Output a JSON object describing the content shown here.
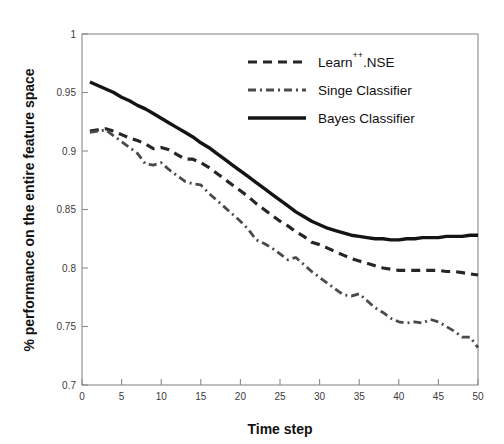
{
  "chart_data": {
    "type": "line",
    "title": "",
    "xlabel": "Time step",
    "ylabel": "% performance on the entire feature space",
    "xlim": [
      0,
      50
    ],
    "ylim": [
      0.7,
      1
    ],
    "grid": false,
    "legend_position": "top-right",
    "xticks": [
      0,
      5,
      10,
      15,
      20,
      25,
      30,
      35,
      40,
      45,
      50
    ],
    "xtick_labels": [
      "0",
      "5",
      "10",
      "15",
      "20",
      "25",
      "30",
      "35",
      "40",
      "45",
      "50"
    ],
    "yticks": [
      0.7,
      0.75,
      0.8,
      0.85,
      0.9,
      0.95,
      1
    ],
    "ytick_labels": [
      "0.7",
      "0.75",
      "0.8",
      "0.85",
      "0.9",
      "0.95",
      "1"
    ],
    "x": [
      1,
      2,
      3,
      4,
      5,
      6,
      7,
      8,
      9,
      10,
      11,
      12,
      13,
      14,
      15,
      16,
      17,
      18,
      19,
      20,
      21,
      22,
      23,
      24,
      25,
      26,
      27,
      28,
      29,
      30,
      31,
      32,
      33,
      34,
      35,
      36,
      37,
      38,
      39,
      40,
      41,
      42,
      43,
      44,
      45,
      46,
      47,
      48,
      49,
      50
    ],
    "series": [
      {
        "name": "Learn++.NSE",
        "style": "dashed",
        "color": "#262626",
        "values": [
          0.917,
          0.918,
          0.919,
          0.917,
          0.914,
          0.911,
          0.909,
          0.906,
          0.902,
          0.903,
          0.901,
          0.897,
          0.893,
          0.893,
          0.89,
          0.886,
          0.881,
          0.876,
          0.871,
          0.866,
          0.861,
          0.855,
          0.85,
          0.845,
          0.84,
          0.836,
          0.831,
          0.827,
          0.822,
          0.82,
          0.817,
          0.814,
          0.811,
          0.808,
          0.806,
          0.804,
          0.802,
          0.8,
          0.799,
          0.798,
          0.798,
          0.798,
          0.798,
          0.798,
          0.798,
          0.797,
          0.797,
          0.796,
          0.795,
          0.794
        ]
      },
      {
        "name": "Singe Classifier",
        "style": "dash-dot",
        "color": "#4a4a4a",
        "values": [
          0.916,
          0.917,
          0.918,
          0.913,
          0.908,
          0.903,
          0.898,
          0.889,
          0.888,
          0.89,
          0.884,
          0.879,
          0.874,
          0.872,
          0.871,
          0.864,
          0.858,
          0.852,
          0.846,
          0.84,
          0.833,
          0.824,
          0.821,
          0.817,
          0.812,
          0.807,
          0.809,
          0.803,
          0.797,
          0.792,
          0.787,
          0.782,
          0.777,
          0.776,
          0.778,
          0.772,
          0.766,
          0.762,
          0.757,
          0.754,
          0.753,
          0.754,
          0.753,
          0.756,
          0.754,
          0.75,
          0.746,
          0.741,
          0.741,
          0.732
        ]
      },
      {
        "name": "Bayes Classifier",
        "style": "solid",
        "color": "#141414",
        "values": [
          0.959,
          0.956,
          0.953,
          0.95,
          0.946,
          0.943,
          0.939,
          0.936,
          0.932,
          0.928,
          0.924,
          0.92,
          0.916,
          0.912,
          0.907,
          0.903,
          0.898,
          0.893,
          0.888,
          0.883,
          0.878,
          0.873,
          0.868,
          0.863,
          0.858,
          0.853,
          0.848,
          0.844,
          0.84,
          0.837,
          0.834,
          0.832,
          0.83,
          0.828,
          0.827,
          0.826,
          0.825,
          0.825,
          0.824,
          0.824,
          0.825,
          0.825,
          0.826,
          0.826,
          0.826,
          0.827,
          0.827,
          0.827,
          0.828,
          0.828
        ]
      }
    ]
  },
  "legend": {
    "entries": [
      {
        "label_main": "Learn",
        "label_sup": "++",
        "label_rest": ".NSE"
      },
      {
        "label_main": "Singe Classifier",
        "label_sup": "",
        "label_rest": ""
      },
      {
        "label_main": "Bayes Classifier",
        "label_sup": "",
        "label_rest": ""
      }
    ]
  }
}
